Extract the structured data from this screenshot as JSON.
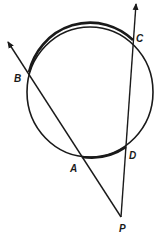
{
  "diagram": {
    "colors": {
      "stroke": "#1a1a1a",
      "background": "#ffffff"
    },
    "circle": {
      "cx": 90,
      "cy": 92,
      "rx": 63,
      "ry": 65
    },
    "points": {
      "A": {
        "label": "A",
        "x": 82,
        "y": 157
      },
      "B": {
        "label": "B",
        "x": 29,
        "y": 72
      },
      "C": {
        "label": "C",
        "x": 133,
        "y": 40
      },
      "D": {
        "label": "D",
        "x": 126,
        "y": 147
      },
      "P": {
        "label": "P",
        "x": 121,
        "y": 217
      }
    },
    "lines": [
      {
        "name": "secant-PAB",
        "from": "P",
        "through": [
          "A",
          "B"
        ],
        "arrow_end": {
          "x": 8,
          "y": 42
        }
      },
      {
        "name": "secant-PDC",
        "from": "P",
        "through": [
          "D",
          "C"
        ],
        "arrow_end": {
          "x": 136,
          "y": 4
        }
      }
    ],
    "highlighted_arcs": [
      "arc-BC",
      "arc-AD"
    ]
  }
}
